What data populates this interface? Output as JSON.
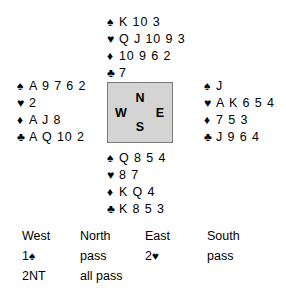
{
  "diagram": {
    "type": "bridge-deal",
    "compass": {
      "north": "N",
      "south": "S",
      "east": "E",
      "west": "W",
      "box_fill": "#d4d4d4",
      "box_border": "#7a7a7a"
    },
    "suit_symbols": {
      "spade": "♠",
      "heart": "♥",
      "diamond": "♦",
      "club": "♣"
    },
    "hands": {
      "north": {
        "label": "North",
        "spades": "K 10 3",
        "hearts": "Q J 10 9 3",
        "diamonds": "10 9 6 2",
        "clubs": "7"
      },
      "west": {
        "label": "West",
        "spades": "A 9 7 6 2",
        "hearts": "2",
        "diamonds": "A J 8",
        "clubs": "A Q 10 2"
      },
      "east": {
        "label": "East",
        "spades": "J",
        "hearts": "A K 6 5 4",
        "diamonds": "7 5 3",
        "clubs": "J 9 6 4"
      },
      "south": {
        "label": "South",
        "spades": "Q 8 5 4",
        "hearts": "8 7",
        "diamonds": "K Q 4",
        "clubs": "K 8 5 3"
      }
    }
  },
  "auction": {
    "columns": [
      {
        "header": "West",
        "bids": [
          {
            "level": "1",
            "suit": "♠",
            "text": ""
          },
          {
            "level": "",
            "suit": "",
            "text": "2NT"
          }
        ]
      },
      {
        "header": "North",
        "bids": [
          {
            "level": "",
            "suit": "",
            "text": "pass"
          },
          {
            "level": "",
            "suit": "",
            "text": "all pass"
          }
        ]
      },
      {
        "header": "East",
        "bids": [
          {
            "level": "2",
            "suit": "♥",
            "text": ""
          },
          {
            "level": "",
            "suit": "",
            "text": ""
          }
        ]
      },
      {
        "header": "South",
        "bids": [
          {
            "level": "",
            "suit": "",
            "text": "pass"
          },
          {
            "level": "",
            "suit": "",
            "text": ""
          }
        ]
      }
    ]
  }
}
